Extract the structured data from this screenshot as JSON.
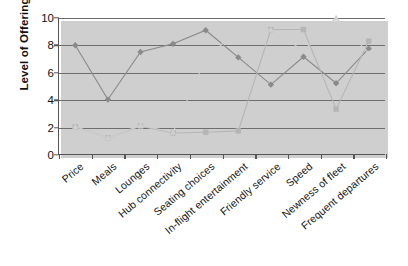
{
  "chart_data": {
    "type": "line",
    "title": "",
    "xlabel": "",
    "ylabel": "Level of Offering",
    "ylim": [
      0,
      10
    ],
    "yticks": [
      0,
      2,
      4,
      6,
      8,
      10
    ],
    "grid": true,
    "legend": "none",
    "categories": [
      "Price",
      "Meals",
      "Lounges",
      "Hub connectivity",
      "Seating choices",
      "In-flight entertainment",
      "Friendly service",
      "Speed",
      "Newness of fleet",
      "Frequent departures"
    ],
    "series": [
      {
        "name": "series-diamond",
        "marker": "diamond",
        "color": "#8a8a8a",
        "values": [
          8.0,
          4.0,
          7.5,
          8.1,
          9.1,
          7.1,
          5.1,
          7.15,
          5.2,
          7.75
        ]
      },
      {
        "name": "series-square",
        "marker": "square",
        "color": "#b5b5b5",
        "values": [
          2.0,
          1.2,
          2.05,
          1.55,
          1.6,
          1.7,
          9.15,
          9.15,
          3.3,
          8.3
        ]
      },
      {
        "name": "series-triangle",
        "marker": "triangle",
        "color": "#cfcfcf",
        "values": [
          2.0,
          1.2,
          2.1,
          1.6,
          7.0,
          9.15,
          9.15,
          7.6,
          10.0,
          7.4
        ]
      }
    ]
  },
  "axis": {
    "y_title": "Level of Offering",
    "y_tick_labels": [
      "0",
      "2",
      "4",
      "6",
      "8",
      "10"
    ]
  },
  "colors": {
    "diamond": "#8a8a8a",
    "square": "#b5b5b5",
    "triangle": "#cfcfcf",
    "grid": "#6e6e6e",
    "axis": "#555555",
    "shadow": "#cfcfcf",
    "text": "#111111",
    "background": "#ffffff"
  }
}
